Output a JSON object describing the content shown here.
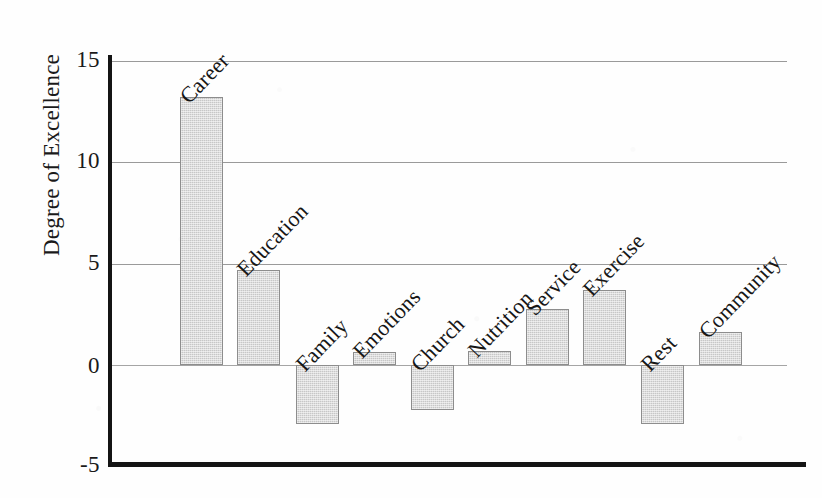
{
  "chart_data": {
    "type": "bar",
    "title": "",
    "subtitle": "",
    "xlabel": "",
    "ylabel": "Degree of Excellence",
    "ylim": [
      -5,
      15
    ],
    "yticks": [
      -5,
      0,
      5,
      10,
      15
    ],
    "ytick_labels": [
      "-5",
      "0",
      "5",
      "10",
      "15"
    ],
    "grid": true,
    "grid_axis": "y",
    "legend": false,
    "legend_position": "none",
    "bar_color": "#c7c7c7",
    "bar_edge_color": "#8d8d8d",
    "axis_color": "#141414",
    "gridline_color": "#9a9a9a",
    "label_rotation": 46,
    "categories": [
      "Career",
      "Education",
      "Family",
      "Emotions",
      "Church",
      "Nutrition",
      "Service",
      "Exercise",
      "Rest",
      "Community"
    ],
    "values": [
      13.2,
      4.7,
      -2.9,
      0.65,
      -2.2,
      0.7,
      2.75,
      3.7,
      -2.9,
      1.65
    ]
  },
  "axis": {
    "y_title": "Degree of Excellence",
    "tick_15": "15",
    "tick_10": "10",
    "tick_5": "5",
    "tick_0": "0",
    "tick_neg5": "-5"
  },
  "bars": [
    {
      "label": "Career",
      "value": 13.2
    },
    {
      "label": "Education",
      "value": 4.7
    },
    {
      "label": "Family",
      "value": -2.9
    },
    {
      "label": "Emotions",
      "value": 0.65
    },
    {
      "label": "Church",
      "value": -2.2
    },
    {
      "label": "Nutrition",
      "value": 0.7
    },
    {
      "label": "Service",
      "value": 2.75
    },
    {
      "label": "Exercise",
      "value": 3.7
    },
    {
      "label": "Rest",
      "value": -2.9
    },
    {
      "label": "Community",
      "value": 1.65
    }
  ]
}
